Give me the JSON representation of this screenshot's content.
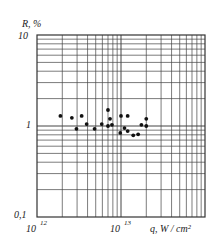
{
  "chart_data": {
    "type": "scatter",
    "title": "",
    "xlabel": "q, W/cm²",
    "ylabel": "R, %",
    "xscale": "log",
    "yscale": "log",
    "xlim": [
      1000000000000.0,
      100000000000000.0
    ],
    "ylim": [
      0.1,
      10
    ],
    "grid": true,
    "legend": null,
    "x_tick_labels": [
      {
        "value": 1000000000000.0,
        "base": "10",
        "exp": "12"
      },
      {
        "value": 10000000000000.0,
        "base": "10",
        "exp": "13"
      }
    ],
    "y_tick_labels": [
      "10",
      "1",
      "0,1"
    ],
    "points": [
      {
        "x": 1900000000000.0,
        "y": 1.29
      },
      {
        "x": 2600000000000.0,
        "y": 1.23
      },
      {
        "x": 2950000000000.0,
        "y": 0.93
      },
      {
        "x": 3400000000000.0,
        "y": 1.29
      },
      {
        "x": 3900000000000.0,
        "y": 1.05
      },
      {
        "x": 4850000000000.0,
        "y": 0.93
      },
      {
        "x": 5900000000000.0,
        "y": 1.05
      },
      {
        "x": 7000000000000.0,
        "y": 1.5
      },
      {
        "x": 7000000000000.0,
        "y": 1.0
      },
      {
        "x": 7400000000000.0,
        "y": 1.2
      },
      {
        "x": 7800000000000.0,
        "y": 1.03
      },
      {
        "x": 9800000000000.0,
        "y": 0.84
      },
      {
        "x": 10000000000000.0,
        "y": 1.29
      },
      {
        "x": 11000000000000.0,
        "y": 0.95
      },
      {
        "x": 12000000000000.0,
        "y": 1.29
      },
      {
        "x": 12000000000000.0,
        "y": 0.88
      },
      {
        "x": 14000000000000.0,
        "y": 0.79
      },
      {
        "x": 16000000000000.0,
        "y": 0.81
      },
      {
        "x": 17500000000000.0,
        "y": 1.03
      },
      {
        "x": 20000000000000.0,
        "y": 1.2
      },
      {
        "x": 20000000000000.0,
        "y": 1.0
      }
    ]
  },
  "labels": {
    "y_axis_title": "R, %",
    "x_axis_title": "q, W / cm²",
    "y_tick_10": "10",
    "y_tick_1": "1",
    "y_tick_01": "0,1",
    "x_tick_12_base": "10",
    "x_tick_12_exp": "12",
    "x_tick_13_base": "10",
    "x_tick_13_exp": "13"
  }
}
